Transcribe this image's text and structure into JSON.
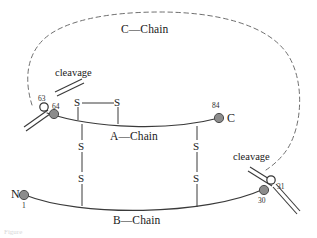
{
  "figure": {
    "kind": "proinsulin-chain-diagram",
    "width": 317,
    "height": 238,
    "background_color": "#ffffff",
    "line_color": "#3a3a3a",
    "node_fill_color": "#8c8c8c",
    "node_open_color": "#ffffff",
    "node_stroke_color": "#333333"
  },
  "chains": {
    "a_chain_label": "A—Chain",
    "b_chain_label": "B—Chain",
    "c_chain_label": "C—Chain"
  },
  "termini": {
    "n_terminus_label": "N",
    "n_terminus_residue": "1",
    "c_terminus_label": "C",
    "c_terminus_residue": "84"
  },
  "cleavage_sites": [
    {
      "label": "cleavage",
      "open_residue": "63",
      "filled_residue": "64",
      "position": "left"
    },
    {
      "label": "cleavage",
      "open_residue": "31",
      "filled_residue": "30",
      "position": "right"
    }
  ],
  "disulfide_bonds": [
    {
      "name": "intra-a-chain",
      "left_atom": "S",
      "right_atom": "S"
    },
    {
      "name": "inter-chain-left",
      "top_atom": "S",
      "bottom_atom": "S"
    },
    {
      "name": "inter-chain-right",
      "top_atom": "S",
      "bottom_atom": "S"
    }
  ],
  "caption": {
    "text": "Figure"
  }
}
